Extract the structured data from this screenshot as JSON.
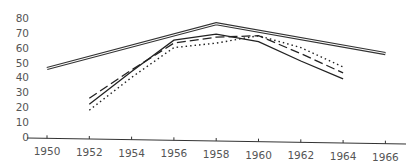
{
  "chart_data": {
    "type": "line",
    "title": "",
    "xlabel": "",
    "ylabel": "",
    "x_ticks": [
      "1950",
      "1952",
      "1954",
      "1956",
      "1958",
      "1960",
      "1962",
      "1964",
      "1966"
    ],
    "y_ticks": [
      "0",
      "10",
      "20",
      "30",
      "40",
      "50",
      "60",
      "70",
      "80"
    ],
    "ylim": [
      0,
      80
    ],
    "xlim": [
      1950,
      1966
    ],
    "grid": false,
    "legend": null,
    "series": [
      {
        "name": "double-line",
        "style": "double",
        "x": [
          1950,
          1958,
          1966
        ],
        "values": [
          46,
          76,
          56
        ]
      },
      {
        "name": "solid",
        "style": "solid",
        "x": [
          1952,
          1954,
          1956,
          1958,
          1960,
          1962,
          1964
        ],
        "values": [
          22,
          44,
          65,
          69,
          64,
          51,
          39
        ]
      },
      {
        "name": "dashed",
        "style": "dashed",
        "x": [
          1952,
          1954,
          1956,
          1958,
          1960,
          1962,
          1964
        ],
        "values": [
          26,
          45,
          63,
          67,
          68,
          56,
          43
        ]
      },
      {
        "name": "dotted",
        "style": "dotted",
        "x": [
          1952,
          1954,
          1956,
          1958,
          1960,
          1962,
          1964
        ],
        "values": [
          18,
          40,
          60,
          63,
          68,
          60,
          47
        ]
      }
    ]
  }
}
